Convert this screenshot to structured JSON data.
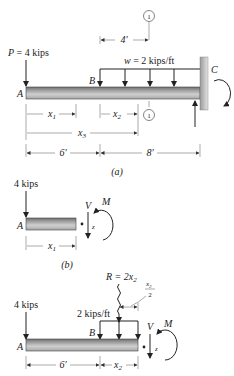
{
  "figure": {
    "part_a": {
      "caption": "(a)",
      "load_P": "P = 4 kips",
      "load_P_italic": "P",
      "load_P_value": "= 4 kips",
      "distributed_load": "w = 2 kips/ft",
      "distributed_load_italic": "w",
      "distributed_load_value": "= 2 kips/ft",
      "point_A": "A",
      "point_B": "B",
      "point_C": "C",
      "section_marker": "1",
      "dim_4ft": "4′",
      "dim_x1": "x",
      "dim_x1_sub": "1",
      "dim_x2": "x",
      "dim_x2_sub": "2",
      "dim_x3": "x",
      "dim_x3_sub": "3",
      "dim_6ft": "6′",
      "dim_8ft": "8′"
    },
    "part_b": {
      "caption": "(b)",
      "load": "4 kips",
      "point_A": "A",
      "shear": "V",
      "moment": "M",
      "axis_z": "z",
      "dim_x1": "x",
      "dim_x1_sub": "1"
    },
    "part_c": {
      "load": "4 kips",
      "resultant": "R = 2x",
      "resultant_sub": "2",
      "resultant_arm_num": "x",
      "resultant_arm_num_sub": "2",
      "resultant_arm_den": "2",
      "distributed_load": "2 kips/ft",
      "point_A": "A",
      "point_B": "B",
      "shear": "V",
      "moment": "M",
      "axis_z": "z",
      "dim_6ft": "6′",
      "dim_x2": "x",
      "dim_x2_sub": "2"
    },
    "colors": {
      "beam_fill_top": "#8a8a8a",
      "beam_fill_mid": "#c8c8c8",
      "wall_fill": "#b0b0b0",
      "ink": "#222222"
    }
  }
}
